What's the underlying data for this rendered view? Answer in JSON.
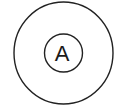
{
  "diagram": {
    "type": "concentric-circles",
    "outer_circle": {
      "cx": 63.5,
      "cy": 53,
      "rx": 49.5,
      "ry": 51
    },
    "inner_circle": {
      "cx": 63.5,
      "cy": 53,
      "r": 19,
      "label": "A"
    },
    "stroke_color": "#222222",
    "background": "#ffffff"
  }
}
